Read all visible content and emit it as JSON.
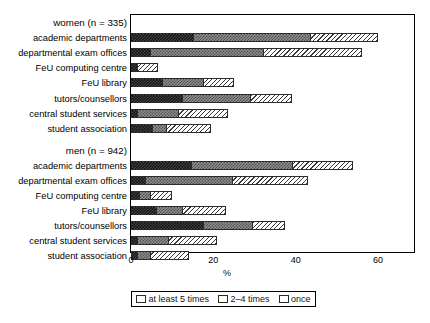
{
  "chart_data": {
    "type": "bar",
    "orientation": "horizontal",
    "stacked": true,
    "title": "",
    "xlabel": "%",
    "ylabel": "",
    "xlim": [
      0,
      65
    ],
    "xticks": [
      0,
      20,
      40,
      60
    ],
    "xtick_labels": [
      "0",
      "20",
      "40",
      "60"
    ],
    "grid": false,
    "legend_position": "bottom",
    "series": [
      {
        "name": "at least 5 times",
        "key": "s5"
      },
      {
        "name": "2–4 times",
        "key": "s24"
      },
      {
        "name": "once",
        "key": "s1"
      }
    ],
    "groups": [
      {
        "label": "women (n = 335)",
        "categories": [
          "academic departments",
          "departmental exam offices",
          "FeU computing centre",
          "FeU library",
          "tutors/counsellors",
          "central student services",
          "student association"
        ],
        "values": {
          "at least 5 times": [
            15.0,
            4.5,
            1.5,
            7.5,
            12.5,
            1.5,
            5.0
          ],
          "2–4 times": [
            28.5,
            27.5,
            0.0,
            10.0,
            16.5,
            10.0,
            3.5
          ],
          "once": [
            16.5,
            24.0,
            5.0,
            7.5,
            10.0,
            12.0,
            11.0
          ]
        },
        "totals": [
          60.0,
          56.0,
          6.5,
          25.0,
          39.0,
          23.5,
          19.5
        ]
      },
      {
        "label": "men (n = 942)",
        "categories": [
          "academic departments",
          "departmental exam offices",
          "FeU computing centre",
          "FeU library",
          "tutors/counsellors",
          "central student services",
          "student association"
        ],
        "values": {
          "at least 5 times": [
            14.5,
            3.5,
            2.0,
            6.0,
            17.5,
            1.5,
            1.5
          ],
          "2–4 times": [
            24.5,
            21.0,
            2.5,
            6.5,
            12.0,
            7.5,
            3.0
          ],
          "once": [
            15.0,
            18.5,
            5.5,
            10.5,
            8.0,
            12.0,
            9.5
          ]
        },
        "totals": [
          54.0,
          43.0,
          10.0,
          23.0,
          37.5,
          21.0,
          14.0
        ]
      }
    ]
  },
  "legend": {
    "items": [
      {
        "label": "at least 5 times"
      },
      {
        "label": "2–4 times"
      },
      {
        "label": "once"
      }
    ]
  },
  "axis": {
    "x_title": "%",
    "ticks": [
      "0",
      "20",
      "40",
      "60"
    ]
  },
  "rows": {
    "women_group": "women (n = 335)",
    "women": [
      "academic departments",
      "departmental exam offices",
      "FeU computing centre",
      "FeU library",
      "tutors/counsellors",
      "central student services",
      "student association"
    ],
    "men_group": "men (n = 942)",
    "men": [
      "academic departments",
      "departmental exam offices",
      "FeU computing centre",
      "FeU library",
      "tutors/counsellors",
      "central student services",
      "student association"
    ]
  },
  "colors": {
    "at_least_5": "#141414",
    "two_to_four": "#8e8e8e",
    "once": "#ffffff",
    "outline": "#000000"
  }
}
